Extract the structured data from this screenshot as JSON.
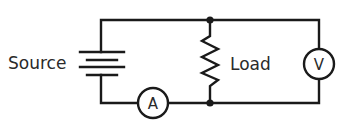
{
  "diagram": {
    "type": "circuit-schematic",
    "colors": {
      "stroke": "#1a1a1a",
      "text": "#2a2a2a",
      "background": "#ffffff"
    },
    "labels": {
      "source": "Source",
      "load": "Load",
      "ammeter": "A",
      "voltmeter": "V"
    },
    "components": [
      {
        "id": "source",
        "kind": "battery",
        "label": "Source"
      },
      {
        "id": "ammeter",
        "kind": "ammeter",
        "label": "A"
      },
      {
        "id": "load",
        "kind": "resistor",
        "label": "Load"
      },
      {
        "id": "voltmeter",
        "kind": "voltmeter",
        "label": "V"
      }
    ],
    "connections": [
      "source(+) -> top wire -> load top junction",
      "load top junction -> voltmeter top",
      "voltmeter bottom -> load bottom junction",
      "load bottom junction -> ammeter -> source(-)"
    ]
  }
}
